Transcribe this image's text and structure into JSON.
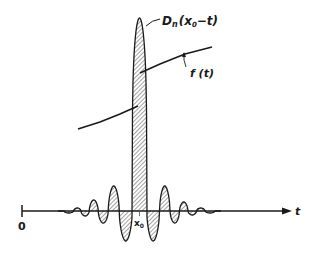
{
  "figure": {
    "kernel_label": "D",
    "kernel_sub": "n",
    "kernel_arg": "(x",
    "kernel_arg_sub": "0",
    "kernel_arg_end": "−t)",
    "function_label": "f (t)",
    "origin_label": "0",
    "x0_label": "x",
    "x0_sub": "0",
    "axis_label": "t"
  },
  "chart_data": {
    "type": "line",
    "title": "",
    "xlabel": "t",
    "ylabel": "",
    "annotations": [
      "D_n(x_0 - t)",
      "f(t)",
      "0",
      "x_0",
      "t"
    ],
    "series": [
      {
        "name": "D_n(x_0 - t)",
        "description": "Dirichlet kernel centred at x_0: tall hatched main lobe with decaying alternating side lobes",
        "center_px": 139.5,
        "baseline_px": 211,
        "peak_height_px": 193,
        "lobe_halfwidth_px": 9.5,
        "lobes": [
          {
            "center": 139.5,
            "height": 193
          },
          {
            "center": 125,
            "height": -30
          },
          {
            "center": 154,
            "height": -30
          },
          {
            "center": 113.5,
            "height": 25
          },
          {
            "center": 165,
            "height": 25
          },
          {
            "center": 103,
            "height": -12
          },
          {
            "center": 175,
            "height": -12
          },
          {
            "center": 93.5,
            "height": 11
          },
          {
            "center": 184,
            "height": 9
          },
          {
            "center": 85,
            "height": -5
          },
          {
            "center": 192,
            "height": -4
          },
          {
            "center": 77,
            "height": 3
          },
          {
            "center": 201,
            "height": 3
          },
          {
            "center": 70,
            "height": -2
          },
          {
            "center": 209,
            "height": -2
          }
        ]
      },
      {
        "name": "f(t)",
        "description": "Piecewise smooth function with a jump discontinuity at x_0",
        "segments": [
          [
            [
              78,
              129
            ],
            [
              100,
              122
            ],
            [
              120,
              114
            ],
            [
              138,
              106
            ]
          ],
          [
            [
              140,
              73
            ],
            [
              160,
              64
            ],
            [
              185,
              54
            ],
            [
              212,
              47
            ]
          ]
        ]
      }
    ],
    "axis": {
      "x_start_px": 22,
      "x_end_px": 292,
      "y_px": 211
    }
  }
}
